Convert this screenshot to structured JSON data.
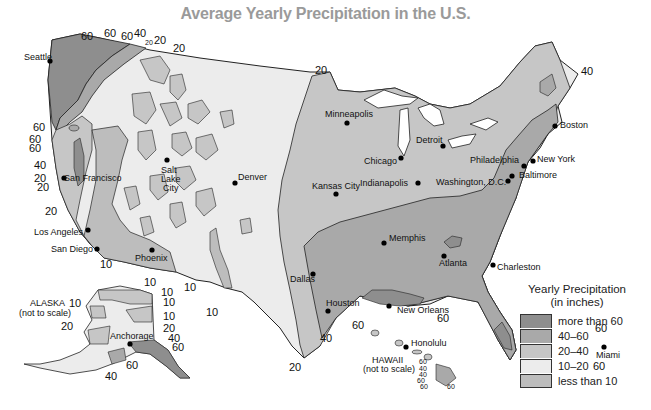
{
  "title": "Average Yearly Precipitation in the U.S.",
  "colors": {
    "more_than_60": "#8e8e8e",
    "40_60": "#a9a9a9",
    "20_40": "#c6c6c6",
    "10_20": "#ececec",
    "less_than_10": "#bdbdbd",
    "outline": "#222222",
    "title": "#9a9a9a"
  },
  "legend": {
    "title_line1": "Yearly Precipitation",
    "title_line2": "(in inches)",
    "items": [
      {
        "label": "more than 60",
        "color": "#8e8e8e"
      },
      {
        "label": "40–60",
        "color": "#a9a9a9"
      },
      {
        "label": "20–40",
        "color": "#c6c6c6"
      },
      {
        "label": "10–20",
        "color": "#ececec"
      },
      {
        "label": "less than 10",
        "color": "#bdbdbd"
      }
    ]
  },
  "cities": [
    {
      "name": "Seattle",
      "x": 50,
      "y": 61
    },
    {
      "name": "San Francisco",
      "x": 64,
      "y": 178
    },
    {
      "name": "Salt Lake City",
      "x": 167,
      "y": 160
    },
    {
      "name": "Denver",
      "x": 235,
      "y": 183
    },
    {
      "name": "Los Angeles",
      "x": 88,
      "y": 230
    },
    {
      "name": "San Diego",
      "x": 97,
      "y": 249
    },
    {
      "name": "Phoenix",
      "x": 152,
      "y": 250
    },
    {
      "name": "Minneapolis",
      "x": 347,
      "y": 123
    },
    {
      "name": "Chicago",
      "x": 401,
      "y": 158
    },
    {
      "name": "Detroit",
      "x": 443,
      "y": 146
    },
    {
      "name": "Boston",
      "x": 555,
      "y": 126
    },
    {
      "name": "New York",
      "x": 533,
      "y": 161
    },
    {
      "name": "Philadelphia",
      "x": 524,
      "y": 166
    },
    {
      "name": "Baltimore",
      "x": 512,
      "y": 176
    },
    {
      "name": "Washington, D.C.",
      "x": 508,
      "y": 181
    },
    {
      "name": "Indianapolis",
      "x": 418,
      "y": 183
    },
    {
      "name": "Kansas City",
      "x": 336,
      "y": 194
    },
    {
      "name": "Memphis",
      "x": 384,
      "y": 243
    },
    {
      "name": "Atlanta",
      "x": 444,
      "y": 256
    },
    {
      "name": "Charleston",
      "x": 493,
      "y": 265
    },
    {
      "name": "Dallas",
      "x": 313,
      "y": 274
    },
    {
      "name": "Houston",
      "x": 328,
      "y": 311
    },
    {
      "name": "New Orleans",
      "x": 389,
      "y": 306
    },
    {
      "name": "Miami",
      "x": 604,
      "y": 347
    },
    {
      "name": "Anchorage",
      "x": 130,
      "y": 344
    },
    {
      "name": "Honolulu",
      "x": 406,
      "y": 347
    }
  ],
  "city_labels": [
    {
      "text": "Seattle",
      "x": 24,
      "y": 60
    },
    {
      "text": "San Francisco",
      "x": 64,
      "y": 181
    },
    {
      "text": "Salt",
      "x": 161,
      "y": 173
    },
    {
      "text": "Lake",
      "x": 161,
      "y": 182
    },
    {
      "text": "City",
      "x": 163,
      "y": 191
    },
    {
      "text": "Denver",
      "x": 238,
      "y": 180
    },
    {
      "text": "Los Angeles",
      "x": 34,
      "y": 235
    },
    {
      "text": "San Diego",
      "x": 51,
      "y": 252
    },
    {
      "text": "Phoenix",
      "x": 135,
      "y": 261
    },
    {
      "text": "Minneapolis",
      "x": 325,
      "y": 117
    },
    {
      "text": "Chicago",
      "x": 364,
      "y": 164
    },
    {
      "text": "Detroit",
      "x": 416,
      "y": 143
    },
    {
      "text": "Boston",
      "x": 560,
      "y": 128
    },
    {
      "text": "New York",
      "x": 537,
      "y": 162
    },
    {
      "text": "Philadelphia",
      "x": 470,
      "y": 163
    },
    {
      "text": "Baltimore",
      "x": 519,
      "y": 178
    },
    {
      "text": "Washington, D.C.",
      "x": 436,
      "y": 185
    },
    {
      "text": "Indianapolis",
      "x": 360,
      "y": 186
    },
    {
      "text": "Kansas City",
      "x": 312,
      "y": 189
    },
    {
      "text": "Memphis",
      "x": 389,
      "y": 241
    },
    {
      "text": "Atlanta",
      "x": 439,
      "y": 266
    },
    {
      "text": "Charleston",
      "x": 497,
      "y": 270
    },
    {
      "text": "Dallas",
      "x": 290,
      "y": 282
    },
    {
      "text": "Houston",
      "x": 326,
      "y": 306
    },
    {
      "text": "New Orleans",
      "x": 397,
      "y": 313
    },
    {
      "text": "Miami",
      "x": 596,
      "y": 358
    },
    {
      "text": "Anchorage",
      "x": 110,
      "y": 339
    },
    {
      "text": "Honolulu",
      "x": 411,
      "y": 346
    }
  ],
  "isohyet_labels": [
    {
      "text": "60",
      "x": 81,
      "y": 40
    },
    {
      "text": "60",
      "x": 104,
      "y": 37
    },
    {
      "text": "60",
      "x": 121,
      "y": 40
    },
    {
      "text": "40",
      "x": 134,
      "y": 37
    },
    {
      "text": "20",
      "x": 145,
      "y": 45,
      "small": true
    },
    {
      "text": "20",
      "x": 154,
      "y": 44
    },
    {
      "text": "20",
      "x": 173,
      "y": 52
    },
    {
      "text": "60",
      "x": 33,
      "y": 131
    },
    {
      "text": "60",
      "x": 29,
      "y": 143
    },
    {
      "text": "60",
      "x": 29,
      "y": 152
    },
    {
      "text": "40",
      "x": 34,
      "y": 169
    },
    {
      "text": "20",
      "x": 34,
      "y": 182
    },
    {
      "text": "20",
      "x": 37,
      "y": 191
    },
    {
      "text": "20",
      "x": 45,
      "y": 215
    },
    {
      "text": "10",
      "x": 100,
      "y": 268
    },
    {
      "text": "10",
      "x": 144,
      "y": 286
    },
    {
      "text": "10",
      "x": 184,
      "y": 291
    },
    {
      "text": "10",
      "x": 206,
      "y": 316
    },
    {
      "text": "20",
      "x": 315,
      "y": 74
    },
    {
      "text": "40",
      "x": 581,
      "y": 75
    },
    {
      "text": "60",
      "x": 352,
      "y": 329
    },
    {
      "text": "40",
      "x": 320,
      "y": 342
    },
    {
      "text": "60",
      "x": 437,
      "y": 322
    },
    {
      "text": "20",
      "x": 289,
      "y": 371
    },
    {
      "text": "60",
      "x": 595,
      "y": 332
    },
    {
      "text": "60",
      "x": 593,
      "y": 370
    },
    {
      "text": "10",
      "x": 161,
      "y": 296
    },
    {
      "text": "10",
      "x": 163,
      "y": 306
    },
    {
      "text": "10",
      "x": 163,
      "y": 320
    },
    {
      "text": "10",
      "x": 69,
      "y": 307
    },
    {
      "text": "20",
      "x": 61,
      "y": 330
    },
    {
      "text": "20",
      "x": 163,
      "y": 332
    },
    {
      "text": "40",
      "x": 168,
      "y": 342
    },
    {
      "text": "60",
      "x": 172,
      "y": 351
    },
    {
      "text": "60",
      "x": 126,
      "y": 369
    },
    {
      "text": "40",
      "x": 105,
      "y": 380
    }
  ],
  "hawaii_labels": [
    {
      "text": "60",
      "x": 419,
      "y": 364
    },
    {
      "text": "40",
      "x": 419,
      "y": 371
    },
    {
      "text": "40",
      "x": 419,
      "y": 377
    },
    {
      "text": "60",
      "x": 417,
      "y": 383
    },
    {
      "text": "60",
      "x": 420,
      "y": 389
    },
    {
      "text": "60",
      "x": 447,
      "y": 389
    }
  ],
  "insets": {
    "alaska_line1": "ALASKA",
    "alaska_line2": "(not to scale)",
    "hawaii_line1": "HAWAII",
    "hawaii_line2": "(not to scale)"
  }
}
